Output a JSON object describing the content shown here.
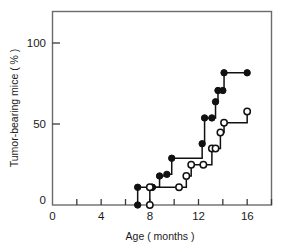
{
  "chart_data": {
    "type": "line",
    "title": "",
    "xlabel": "Age ( months )",
    "ylabel": "Tumor-bearing mice ( % )",
    "xlim": [
      0,
      18
    ],
    "ylim": [
      0,
      120
    ],
    "grid": false,
    "legend": "none",
    "step_style": "post",
    "x_ticks_major": [
      0,
      4,
      8,
      12,
      16
    ],
    "x_ticks_minor": [
      2,
      6,
      10,
      14,
      18
    ],
    "y_ticks_major": [
      0,
      50,
      100
    ],
    "x_tick_labels": [
      "0",
      "4",
      "8",
      "12",
      "16"
    ],
    "y_tick_labels": [
      "0",
      "50",
      "100"
    ],
    "series": [
      {
        "name": "closed-circles",
        "marker": "filled-circle",
        "color": "#111111",
        "x": [
          7,
          7,
          8.2,
          8.2,
          8.8,
          9.4,
          9.8,
          12.3,
          12.5,
          13.1,
          13.4,
          13.6,
          14.0,
          14.1,
          16.0
        ],
        "y": [
          0,
          11,
          11,
          11,
          18,
          19,
          29,
          38,
          54,
          54,
          64,
          71,
          71,
          82,
          82
        ],
        "values": [
          0,
          11,
          11,
          11,
          18,
          19,
          29,
          38,
          54,
          54,
          64,
          71,
          71,
          82,
          82
        ]
      },
      {
        "name": "open-circles",
        "marker": "open-circle",
        "color": "#111111",
        "x": [
          8.0,
          8.0,
          10.4,
          11.0,
          11.4,
          12.4,
          13.1,
          13.4,
          13.8,
          14.1,
          16.0
        ],
        "y": [
          0,
          11,
          11,
          18,
          25,
          25,
          35,
          35,
          45,
          51,
          58
        ],
        "values": [
          0,
          11,
          11,
          18,
          25,
          25,
          35,
          35,
          45,
          51,
          58
        ]
      }
    ]
  },
  "axes": {
    "x_label": "Age ( months )",
    "y_label": "Tumor-bearing mice ( % )",
    "x_tick_0": "0",
    "x_tick_1": "4",
    "x_tick_2": "8",
    "x_tick_3": "12",
    "x_tick_4": "16",
    "y_tick_0": "0",
    "y_tick_1": "50",
    "y_tick_2": "100"
  },
  "colors": {
    "frame": "#6b6b6b",
    "axis": "#3a3a3a",
    "data": "#111111",
    "background": "#ffffff"
  }
}
